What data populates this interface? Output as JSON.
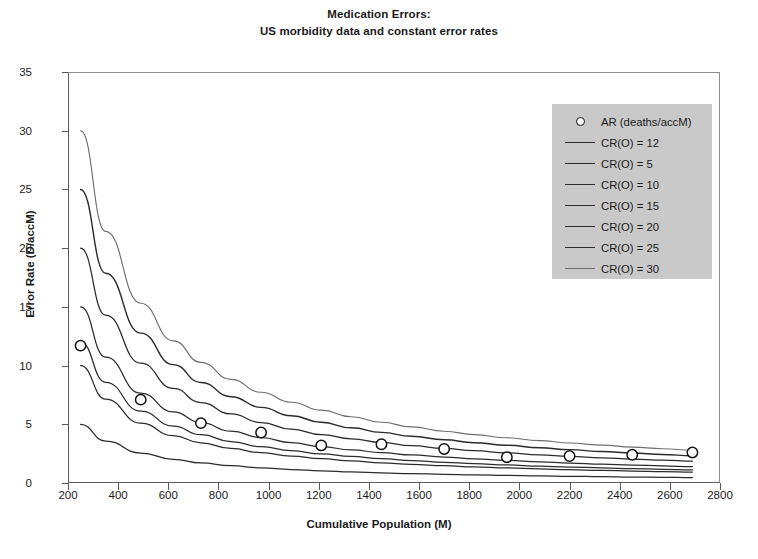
{
  "chart_data": {
    "type": "line",
    "title": "Medication Errors:",
    "subtitle": "US morbidity data and constant error rates",
    "xlabel": "Cumulative Population (M)",
    "ylabel": "Error Rate (D/accM)",
    "xlim": [
      200,
      2800
    ],
    "ylim": [
      0,
      35
    ],
    "xticks": [
      200,
      400,
      600,
      800,
      1000,
      1200,
      1400,
      1600,
      1800,
      2000,
      2200,
      2400,
      2600,
      2800
    ],
    "yticks": [
      0,
      5,
      10,
      15,
      20,
      25,
      30,
      35
    ],
    "grid": false,
    "legend_position": "top-right",
    "scatter_series": {
      "name": "AR (deaths/accM)",
      "marker": "open-circle",
      "x": [
        250,
        490,
        730,
        970,
        1210,
        1450,
        1700,
        1950,
        2200,
        2450,
        2690
      ],
      "y": [
        11.7,
        7.1,
        5.1,
        4.3,
        3.2,
        3.3,
        2.9,
        2.2,
        2.3,
        2.4,
        2.6
      ]
    },
    "series": [
      {
        "name": "CR(O) = 12",
        "cr": 12,
        "x0": 250,
        "color": "#2b2b2b",
        "width": 1.25,
        "x": [
          250,
          350,
          490,
          620,
          730,
          850,
          970,
          1090,
          1210,
          1330,
          1450,
          1570,
          1700,
          1820,
          1950,
          2080,
          2200,
          2330,
          2450,
          2570,
          2690
        ],
        "y": [
          12.0,
          8.57,
          6.12,
          4.84,
          4.11,
          3.53,
          3.09,
          2.75,
          2.48,
          2.26,
          2.07,
          1.91,
          1.76,
          1.65,
          1.54,
          1.44,
          1.36,
          1.29,
          1.22,
          1.17,
          1.12
        ]
      },
      {
        "name": "CR(O) = 5",
        "cr": 5,
        "x0": 250,
        "color": "#2b2b2b",
        "width": 1.25,
        "x": [
          250,
          350,
          490,
          620,
          730,
          850,
          970,
          1090,
          1210,
          1330,
          1450,
          1570,
          1700,
          1820,
          1950,
          2080,
          2200,
          2330,
          2450,
          2570,
          2690
        ],
        "y": [
          5.0,
          3.57,
          2.55,
          2.02,
          1.71,
          1.47,
          1.29,
          1.15,
          1.03,
          0.94,
          0.86,
          0.8,
          0.74,
          0.69,
          0.64,
          0.6,
          0.57,
          0.54,
          0.51,
          0.49,
          0.46
        ]
      },
      {
        "name": "CR(O) = 10",
        "cr": 10,
        "x0": 250,
        "color": "#2b2b2b",
        "width": 1.25,
        "x": [
          250,
          350,
          490,
          620,
          730,
          850,
          970,
          1090,
          1210,
          1330,
          1450,
          1570,
          1700,
          1820,
          1950,
          2080,
          2200,
          2330,
          2450,
          2570,
          2690
        ],
        "y": [
          10.0,
          7.14,
          5.1,
          4.03,
          3.42,
          2.94,
          2.58,
          2.29,
          2.07,
          1.88,
          1.72,
          1.59,
          1.47,
          1.37,
          1.28,
          1.2,
          1.14,
          1.07,
          1.02,
          0.97,
          0.93
        ]
      },
      {
        "name": "CR(O) = 15",
        "cr": 15,
        "x0": 250,
        "color": "#2b2b2b",
        "width": 1.25,
        "x": [
          250,
          350,
          490,
          620,
          730,
          850,
          970,
          1090,
          1210,
          1330,
          1450,
          1570,
          1700,
          1820,
          1950,
          2080,
          2200,
          2330,
          2450,
          2570,
          2690
        ],
        "y": [
          15.0,
          10.71,
          7.65,
          6.05,
          5.14,
          4.41,
          3.87,
          3.44,
          3.1,
          2.82,
          2.59,
          2.39,
          2.21,
          2.06,
          1.92,
          1.8,
          1.7,
          1.61,
          1.53,
          1.46,
          1.39
        ]
      },
      {
        "name": "CR(O) = 20",
        "cr": 20,
        "x0": 250,
        "color": "#2b2b2b",
        "width": 1.25,
        "x": [
          250,
          350,
          490,
          620,
          730,
          850,
          970,
          1090,
          1210,
          1330,
          1450,
          1570,
          1700,
          1820,
          1950,
          2080,
          2200,
          2330,
          2450,
          2570,
          2690
        ],
        "y": [
          20.0,
          14.29,
          10.2,
          8.06,
          6.85,
          5.88,
          5.15,
          4.59,
          4.13,
          3.76,
          3.45,
          3.18,
          2.94,
          2.75,
          2.56,
          2.4,
          2.27,
          2.15,
          2.04,
          1.95,
          1.86
        ]
      },
      {
        "name": "CR(O) = 25",
        "cr": 25,
        "x0": 250,
        "color": "#2b2b2b",
        "width": 1.4,
        "x": [
          250,
          350,
          490,
          620,
          730,
          850,
          970,
          1090,
          1210,
          1330,
          1450,
          1570,
          1700,
          1820,
          1950,
          2080,
          2200,
          2330,
          2450,
          2570,
          2690
        ],
        "y": [
          25.0,
          17.86,
          12.76,
          10.08,
          8.56,
          7.35,
          6.44,
          5.73,
          5.17,
          4.7,
          4.31,
          3.98,
          3.68,
          3.43,
          3.21,
          3.0,
          2.84,
          2.68,
          2.55,
          2.43,
          2.32
        ]
      },
      {
        "name": "CR(O) = 30",
        "cr": 30,
        "x0": 250,
        "color": "#6e6e6e",
        "width": 1.15,
        "x": [
          250,
          350,
          490,
          620,
          730,
          850,
          970,
          1090,
          1210,
          1330,
          1450,
          1570,
          1700,
          1820,
          1950,
          2080,
          2200,
          2330,
          2450,
          2570,
          2690
        ],
        "y": [
          30.0,
          21.43,
          15.31,
          12.1,
          10.27,
          8.82,
          7.73,
          6.88,
          6.2,
          5.64,
          5.17,
          4.78,
          4.41,
          4.12,
          3.85,
          3.61,
          3.41,
          3.22,
          3.06,
          2.92,
          2.79
        ]
      }
    ],
    "legend_entries": [
      {
        "label": "AR (deaths/accM)",
        "key": "marker"
      },
      {
        "label": "CR(O) = 12",
        "key": "line"
      },
      {
        "label": "CR(O) = 5",
        "key": "line"
      },
      {
        "label": "CR(O) = 10",
        "key": "line"
      },
      {
        "label": "CR(O) = 15",
        "key": "line"
      },
      {
        "label": "CR(O) = 20",
        "key": "line"
      },
      {
        "label": "CR(O) = 25",
        "key": "line"
      },
      {
        "label": "CR(O) = 30",
        "key": "line"
      }
    ]
  }
}
